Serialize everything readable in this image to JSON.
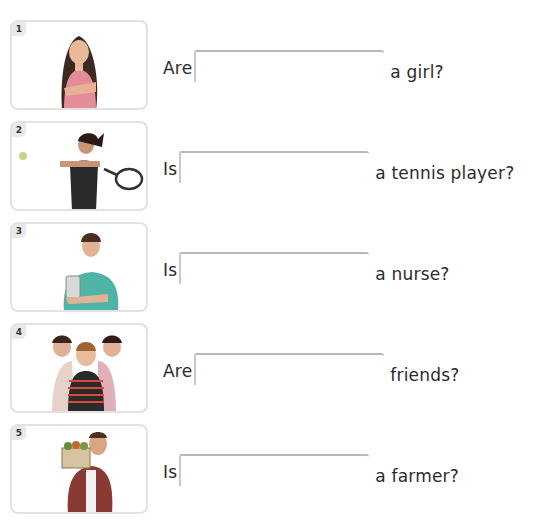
{
  "exercise": {
    "items": [
      {
        "number": "1",
        "image": "girl-with-crossed-arms",
        "prefix": "Are",
        "answer": "",
        "suffix": "a girl?"
      },
      {
        "number": "2",
        "image": "woman-playing-tennis",
        "prefix": "Is",
        "answer": "",
        "suffix": "a tennis player?"
      },
      {
        "number": "3",
        "image": "nurse-holding-clipboard",
        "prefix": "Is",
        "answer": "",
        "suffix": "a nurse?"
      },
      {
        "number": "4",
        "image": "three-children-friends",
        "prefix": "Are",
        "answer": "",
        "suffix": "friends?"
      },
      {
        "number": "5",
        "image": "man-holding-vegetable-crate",
        "prefix": "Is",
        "answer": "",
        "suffix": "a farmer?"
      }
    ]
  }
}
